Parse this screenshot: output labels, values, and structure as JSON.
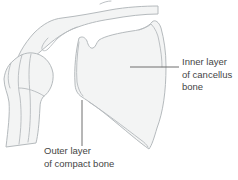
{
  "labels": {
    "inner": {
      "lines": [
        "Inner layer",
        "of cancellus",
        "bone"
      ]
    },
    "outer": {
      "lines": [
        "Outer layer",
        "of compact bone"
      ]
    }
  },
  "colors": {
    "background": "#ffffff",
    "bone-outline": "#b5babd",
    "bone-fill": "#f3f4f4",
    "leader-line": "#6e6e6e",
    "text": "#454545"
  }
}
